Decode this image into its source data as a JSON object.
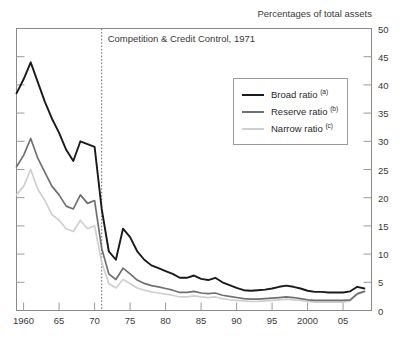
{
  "header": {
    "title": "",
    "unit_label": "Percentages of total assets"
  },
  "annotation": {
    "text": "Competition & Credit Control, 1971",
    "year": 1971
  },
  "legend": {
    "position": "inside-top-right",
    "items": [
      {
        "label": "Broad ratio",
        "note": "(a)",
        "color": "#1a1a1a"
      },
      {
        "label": "Reserve ratio",
        "note": "(b)",
        "color": "#707070"
      },
      {
        "label": "Narrow ratio",
        "note": "(c)",
        "color": "#cfcfcf"
      }
    ]
  },
  "axes": {
    "y": {
      "ticks": [
        "50",
        "45",
        "40",
        "35",
        "30",
        "25",
        "20",
        "15",
        "10",
        "5",
        "0"
      ],
      "min": 0,
      "max": 50,
      "step": 5,
      "side": "right"
    },
    "x": {
      "ticks": [
        "1960",
        "65",
        "70",
        "75",
        "80",
        "85",
        "90",
        "95",
        "2000",
        "05"
      ],
      "tick_years": [
        1960,
        1965,
        1970,
        1975,
        1980,
        1985,
        1990,
        1995,
        2000,
        2005
      ],
      "min": 1959,
      "max": 2009
    }
  },
  "chart_data": {
    "type": "line",
    "title": "",
    "xlabel": "",
    "ylabel": "Percentages of total assets",
    "ylim": [
      0,
      50
    ],
    "xlim": [
      1959,
      2009
    ],
    "grid": false,
    "legend_position": "inside-top-right",
    "annotations": [
      {
        "text": "Competition & Credit Control, 1971",
        "x": 1971,
        "style": "vertical-dotted-line"
      }
    ],
    "x": [
      1959,
      1960,
      1961,
      1962,
      1963,
      1964,
      1965,
      1966,
      1967,
      1968,
      1969,
      1970,
      1971,
      1972,
      1973,
      1974,
      1975,
      1976,
      1977,
      1978,
      1979,
      1980,
      1981,
      1982,
      1983,
      1984,
      1985,
      1986,
      1987,
      1988,
      1989,
      1990,
      1991,
      1992,
      1993,
      1994,
      1995,
      1996,
      1997,
      1998,
      1999,
      2000,
      2001,
      2002,
      2003,
      2004,
      2005,
      2006,
      2007,
      2008
    ],
    "series": [
      {
        "name": "Broad ratio",
        "note": "(a)",
        "color": "#1a1a1a",
        "values": [
          38.5,
          41.0,
          44.0,
          40.5,
          37.0,
          34.0,
          31.5,
          28.5,
          26.5,
          30.0,
          29.5,
          29.0,
          18.0,
          10.5,
          9.0,
          14.5,
          13.0,
          10.5,
          9.0,
          8.0,
          7.5,
          7.0,
          6.5,
          5.8,
          5.8,
          6.2,
          5.6,
          5.4,
          5.8,
          5.0,
          4.5,
          4.0,
          3.6,
          3.5,
          3.6,
          3.7,
          3.9,
          4.2,
          4.4,
          4.2,
          3.9,
          3.5,
          3.3,
          3.3,
          3.2,
          3.2,
          3.2,
          3.4,
          4.2,
          3.9
        ]
      },
      {
        "name": "Reserve ratio",
        "note": "(b)",
        "color": "#707070",
        "values": [
          25.5,
          27.5,
          30.5,
          27.0,
          24.5,
          22.0,
          20.5,
          18.5,
          18.0,
          20.5,
          19.0,
          19.5,
          11.0,
          6.5,
          5.5,
          7.5,
          6.5,
          5.4,
          4.8,
          4.4,
          4.2,
          3.9,
          3.6,
          3.2,
          3.2,
          3.4,
          3.1,
          3.0,
          3.1,
          2.7,
          2.5,
          2.3,
          2.1,
          2.0,
          2.0,
          2.1,
          2.2,
          2.3,
          2.4,
          2.3,
          2.1,
          1.9,
          1.8,
          1.8,
          1.8,
          1.8,
          1.8,
          1.9,
          3.0,
          3.4
        ]
      },
      {
        "name": "Narrow ratio",
        "note": "(c)",
        "color": "#cfcfcf",
        "values": [
          20.5,
          22.0,
          25.0,
          21.5,
          19.5,
          17.0,
          16.0,
          14.5,
          14.0,
          16.0,
          14.5,
          15.0,
          8.5,
          4.8,
          4.0,
          5.5,
          4.8,
          4.0,
          3.6,
          3.3,
          3.1,
          2.9,
          2.7,
          2.4,
          2.4,
          2.6,
          2.4,
          2.3,
          2.4,
          2.1,
          1.9,
          1.8,
          1.7,
          1.6,
          1.6,
          1.7,
          1.8,
          1.9,
          2.0,
          1.9,
          1.8,
          1.6,
          1.5,
          1.5,
          1.5,
          1.5,
          1.5,
          1.7,
          2.8,
          3.3
        ]
      }
    ]
  }
}
